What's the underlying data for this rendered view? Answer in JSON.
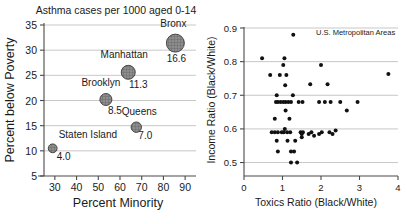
{
  "figure": {
    "name": "two-panel-statistics-figure",
    "width": 407,
    "height": 224,
    "background": "#ffffff"
  },
  "chart_data": [
    {
      "type": "scatter",
      "name": "asthma-bubble-chart",
      "title": "Asthma cases per 1000 aged 0-14",
      "xlabel": "Percent Minority",
      "ylabel": "Percent below Poverty",
      "xlim": [
        25,
        95
      ],
      "ylim": [
        5,
        35
      ],
      "xticks": [
        30,
        40,
        50,
        60,
        70,
        80,
        90
      ],
      "yticks": [
        5,
        10,
        15,
        20,
        25,
        30,
        35
      ],
      "grid": "horizontal",
      "legend": "none",
      "size_encodes": "Asthma cases per 1000 aged 0-14",
      "points": [
        {
          "label": "Bronx",
          "x": 85.5,
          "y": 31.4,
          "value": 16.6,
          "r": 9.0,
          "label_dx": -2,
          "label_dy": -16,
          "label_anchor": "middle",
          "value_dx": 1,
          "value_dy": 19,
          "value_anchor": "middle"
        },
        {
          "label": "Manhattan",
          "x": 63.8,
          "y": 25.6,
          "value": 11.3,
          "r": 7.0,
          "label_dx": -4,
          "label_dy": -14,
          "label_anchor": "middle",
          "value_dx": 10,
          "value_dy": 16,
          "value_anchor": "middle"
        },
        {
          "label": "Brooklyn",
          "x": 53.5,
          "y": 20.2,
          "value": 8.5,
          "r": 6.0,
          "label_dx": -5,
          "label_dy": -13,
          "label_anchor": "middle",
          "value_dx": 9,
          "value_dy": 15,
          "value_anchor": "middle"
        },
        {
          "label": "Queens",
          "x": 67.5,
          "y": 14.7,
          "value": 7.0,
          "r": 5.2,
          "label_dx": 3,
          "label_dy": -12,
          "label_anchor": "middle",
          "value_dx": 9,
          "value_dy": 12,
          "value_anchor": "middle"
        },
        {
          "label": "Staten Island",
          "x": 29.0,
          "y": 10.5,
          "value": 4.0,
          "r": 4.4,
          "label_dx": 6,
          "label_dy": -10,
          "label_anchor": "start",
          "value_dx": 4,
          "value_dy": 12,
          "value_anchor": "start"
        }
      ]
    },
    {
      "type": "scatter",
      "name": "toxics-income-scatter",
      "title": "",
      "annotation": "U.S. Metropolitan Areas",
      "xlabel": "Toxics Ratio (Black/White)",
      "ylabel": "Income Ratio (Black/White)",
      "xlim": [
        0,
        4
      ],
      "ylim": [
        0.46,
        0.9
      ],
      "xticks": [
        0,
        1,
        2,
        3,
        4
      ],
      "yticks": [
        0.5,
        0.6,
        0.7,
        0.8,
        0.9
      ],
      "ytick_labels": [
        "0.5",
        "0.6",
        "0.7",
        "0.8",
        "0.9"
      ],
      "grid": "horizontal",
      "legend": "none",
      "points": [
        [
          1.28,
          0.88
        ],
        [
          0.47,
          0.81
        ],
        [
          1.05,
          0.81
        ],
        [
          1.02,
          0.79
        ],
        [
          2.0,
          0.79
        ],
        [
          0.68,
          0.76
        ],
        [
          0.93,
          0.76
        ],
        [
          1.1,
          0.76
        ],
        [
          3.75,
          0.763
        ],
        [
          1.07,
          0.73
        ],
        [
          1.72,
          0.733
        ],
        [
          2.17,
          0.733
        ],
        [
          0.85,
          0.7
        ],
        [
          1.27,
          0.7
        ],
        [
          0.83,
          0.68
        ],
        [
          0.88,
          0.68
        ],
        [
          0.95,
          0.68
        ],
        [
          1.02,
          0.68
        ],
        [
          1.08,
          0.68
        ],
        [
          1.15,
          0.68
        ],
        [
          1.22,
          0.68
        ],
        [
          1.42,
          0.68
        ],
        [
          1.52,
          0.68
        ],
        [
          1.95,
          0.68
        ],
        [
          2.1,
          0.68
        ],
        [
          2.25,
          0.68
        ],
        [
          2.5,
          0.68
        ],
        [
          2.95,
          0.68
        ],
        [
          1.08,
          0.655
        ],
        [
          2.67,
          0.655
        ],
        [
          0.8,
          0.63
        ],
        [
          1.18,
          0.63
        ],
        [
          0.72,
          0.59
        ],
        [
          0.8,
          0.59
        ],
        [
          0.88,
          0.59
        ],
        [
          0.98,
          0.59
        ],
        [
          1.03,
          0.59
        ],
        [
          1.06,
          0.6
        ],
        [
          1.12,
          0.59
        ],
        [
          1.2,
          0.59
        ],
        [
          1.47,
          0.59
        ],
        [
          1.5,
          0.585
        ],
        [
          1.53,
          0.59
        ],
        [
          1.5,
          0.575
        ],
        [
          1.68,
          0.585
        ],
        [
          1.75,
          0.59
        ],
        [
          1.82,
          0.58
        ],
        [
          1.95,
          0.585
        ],
        [
          2.02,
          0.59
        ],
        [
          2.22,
          0.59
        ],
        [
          2.3,
          0.585
        ],
        [
          2.38,
          0.595
        ],
        [
          0.85,
          0.565
        ],
        [
          1.13,
          0.565
        ],
        [
          1.33,
          0.565
        ],
        [
          0.88,
          0.533
        ],
        [
          1.22,
          0.533
        ],
        [
          1.3,
          0.533
        ],
        [
          1.22,
          0.5
        ],
        [
          1.38,
          0.5
        ]
      ]
    }
  ]
}
